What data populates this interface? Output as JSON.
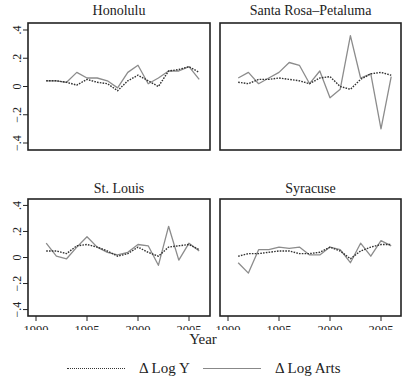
{
  "chart_data": [
    {
      "type": "line",
      "title": "Honolulu",
      "x": [
        1991,
        1992,
        1993,
        1994,
        1995,
        1996,
        1997,
        1998,
        1999,
        2000,
        2001,
        2002,
        2003,
        2004,
        2005,
        2006
      ],
      "series": [
        {
          "name": "Δ Log Y",
          "style": "dotted",
          "values": [
            0.04,
            0.04,
            0.03,
            0.01,
            0.05,
            0.03,
            0.02,
            -0.03,
            0.04,
            0.08,
            0.04,
            0.0,
            0.11,
            0.12,
            0.14,
            0.1
          ]
        },
        {
          "name": "Δ Log Arts",
          "style": "solid",
          "values": [
            0.04,
            0.04,
            0.03,
            0.1,
            0.06,
            0.06,
            0.04,
            -0.01,
            0.1,
            0.15,
            0.02,
            0.06,
            0.11,
            0.11,
            0.14,
            0.05
          ]
        }
      ],
      "xlabel": "",
      "ylabel": "",
      "ylim": [
        -0.45,
        0.45
      ]
    },
    {
      "type": "line",
      "title": "Santa Rosa–Petaluma",
      "x": [
        1991,
        1992,
        1993,
        1994,
        1995,
        1996,
        1997,
        1998,
        1999,
        2000,
        2001,
        2002,
        2003,
        2004,
        2005,
        2006
      ],
      "series": [
        {
          "name": "Δ Log Y",
          "style": "dotted",
          "values": [
            0.03,
            0.02,
            0.05,
            0.05,
            0.06,
            0.05,
            0.04,
            0.02,
            0.06,
            0.07,
            0.0,
            -0.02,
            0.05,
            0.09,
            0.1,
            0.08
          ]
        },
        {
          "name": "Δ Log Arts",
          "style": "solid",
          "values": [
            0.06,
            0.1,
            0.02,
            0.06,
            0.1,
            0.17,
            0.15,
            0.02,
            0.11,
            -0.08,
            -0.02,
            0.36,
            0.06,
            0.09,
            -0.3,
            0.07
          ]
        }
      ],
      "xlabel": "",
      "ylabel": "",
      "ylim": [
        -0.45,
        0.45
      ]
    },
    {
      "type": "line",
      "title": "St. Louis",
      "x": [
        1991,
        1992,
        1993,
        1994,
        1995,
        1996,
        1997,
        1998,
        1999,
        2000,
        2001,
        2002,
        2003,
        2004,
        2005,
        2006
      ],
      "series": [
        {
          "name": "Δ Log Y",
          "style": "dotted",
          "values": [
            0.05,
            0.05,
            0.03,
            0.09,
            0.1,
            0.08,
            0.05,
            0.01,
            0.03,
            0.08,
            0.04,
            0.01,
            0.08,
            0.09,
            0.1,
            0.06
          ]
        },
        {
          "name": "Δ Log Arts",
          "style": "solid",
          "values": [
            0.11,
            0.01,
            -0.01,
            0.08,
            0.16,
            0.08,
            0.04,
            0.02,
            0.04,
            0.1,
            0.09,
            -0.06,
            0.24,
            -0.02,
            0.11,
            0.05
          ]
        }
      ],
      "xlabel": "Year",
      "ylabel": "",
      "ylim": [
        -0.45,
        0.45
      ]
    },
    {
      "type": "line",
      "title": "Syracuse",
      "x": [
        1991,
        1992,
        1993,
        1994,
        1995,
        1996,
        1997,
        1998,
        1999,
        2000,
        2001,
        2002,
        2003,
        2004,
        2005,
        2006
      ],
      "series": [
        {
          "name": "Δ Log Y",
          "style": "dotted",
          "values": [
            0.01,
            0.03,
            0.03,
            0.04,
            0.05,
            0.05,
            0.03,
            0.03,
            0.04,
            0.08,
            0.05,
            -0.01,
            0.05,
            0.08,
            0.1,
            0.1
          ]
        },
        {
          "name": "Δ Log Arts",
          "style": "solid",
          "values": [
            -0.04,
            -0.12,
            0.06,
            0.06,
            0.08,
            0.07,
            0.08,
            0.02,
            0.02,
            0.08,
            0.06,
            -0.04,
            0.11,
            0.01,
            0.13,
            0.09
          ]
        }
      ],
      "xlabel": "Year",
      "ylabel": "",
      "ylim": [
        -0.45,
        0.45
      ]
    }
  ],
  "axes": {
    "y_ticks": [
      0.4,
      0.2,
      0,
      -0.2,
      -0.4
    ],
    "y_tick_labels": [
      ".4",
      ".2",
      "0",
      "−.2",
      "−.4"
    ],
    "x_ticks": [
      1990,
      1995,
      2000,
      2005
    ],
    "x_tick_labels": [
      "1990",
      "1995",
      "2000",
      "2005"
    ],
    "x_title": "Year"
  },
  "legend": {
    "items": [
      {
        "label": "Δ Log Y",
        "style": "dotted"
      },
      {
        "label": "Δ Log Arts",
        "style": "solid"
      }
    ]
  },
  "colors": {
    "log_y": "#333333",
    "log_arts": "#8c8c8c",
    "frame": "#222222"
  }
}
